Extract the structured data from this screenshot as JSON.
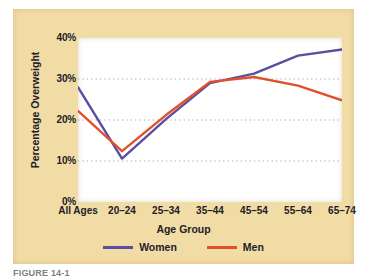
{
  "figure": {
    "caption": "FIGURE 14-1",
    "background_color": "#f2dca5",
    "plot_background_color": "#ffffff"
  },
  "chart_data": {
    "type": "line",
    "title": "",
    "xlabel": "Age Group",
    "ylabel": "Percentage Overweight",
    "categories": [
      "All Ages",
      "20–24",
      "25–34",
      "35–44",
      "45–54",
      "55–64",
      "65–74"
    ],
    "ylim": [
      0,
      40
    ],
    "yticks": [
      0,
      10,
      20,
      30,
      40
    ],
    "ytick_labels": [
      "0%",
      "10%",
      "20%",
      "30%",
      "40%"
    ],
    "grid": "horizontal-dotted",
    "legend_position": "bottom-center",
    "series": [
      {
        "name": "Women",
        "color": "#5b4f9e",
        "values": [
          28,
          10.6,
          20.2,
          29,
          31.3,
          35.7,
          37.2
        ]
      },
      {
        "name": "Men",
        "color": "#e1502a",
        "values": [
          22.2,
          12.4,
          21.2,
          29.3,
          30.5,
          28.4,
          24.8
        ]
      }
    ]
  }
}
